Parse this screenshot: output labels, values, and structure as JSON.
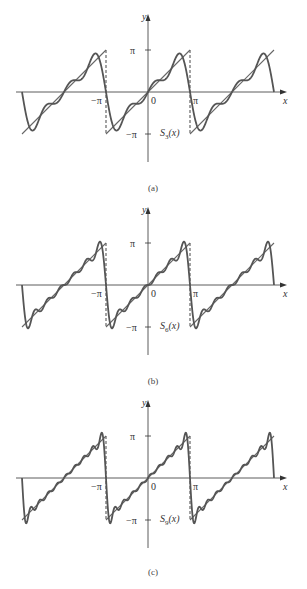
{
  "chart_data": [
    {
      "type": "line",
      "panel": "(a)",
      "title": "",
      "curve_label": "S3(x)",
      "xlabel": "x",
      "ylabel": "y",
      "x_ticks": [
        "−π",
        "0",
        "π"
      ],
      "y_ticks": [
        "π",
        "−π"
      ],
      "xlim": [
        -9.42,
        9.42
      ],
      "ylim": [
        -3.4,
        3.4
      ],
      "grid": false,
      "series": [
        {
          "name": "f(x) = x (periodic sawtooth, period 2π)",
          "style": "thin line with dashed vertical jumps at ±π"
        },
        {
          "name": "S3(x)",
          "n_terms": 3,
          "formula": "2 Σ_{k=1..3} (-1)^{k+1} sin(kx)/k"
        }
      ]
    },
    {
      "type": "line",
      "panel": "(b)",
      "curve_label": "S6(x)",
      "xlabel": "x",
      "ylabel": "y",
      "x_ticks": [
        "−π",
        "0",
        "π"
      ],
      "y_ticks": [
        "π",
        "−π"
      ],
      "xlim": [
        -9.42,
        9.42
      ],
      "ylim": [
        -3.4,
        3.4
      ],
      "grid": false,
      "series": [
        {
          "name": "f(x) = x (periodic sawtooth, period 2π)"
        },
        {
          "name": "S6(x)",
          "n_terms": 6,
          "formula": "2 Σ_{k=1..6} (-1)^{k+1} sin(kx)/k"
        }
      ]
    },
    {
      "type": "line",
      "panel": "(c)",
      "curve_label": "S9(x)",
      "xlabel": "x",
      "ylabel": "y",
      "x_ticks": [
        "−π",
        "0",
        "π"
      ],
      "y_ticks": [
        "π",
        "−π"
      ],
      "xlim": [
        -9.42,
        9.42
      ],
      "ylim": [
        -3.4,
        3.4
      ],
      "grid": false,
      "series": [
        {
          "name": "f(x) = x (periodic sawtooth, period 2π)"
        },
        {
          "name": "S9(x)",
          "n_terms": 9,
          "formula": "2 Σ_{k=1..9} (-1)^{k+1} sin(kx)/k"
        }
      ]
    }
  ],
  "panels": [
    {
      "id": "a",
      "caption": "(a)",
      "curve_label_main": "S",
      "curve_label_sub": "3",
      "curve_label_arg": "(x)",
      "n": 3,
      "axis_y": 92,
      "cap_y": 191
    },
    {
      "id": "b",
      "caption": "(b)",
      "curve_label_main": "S",
      "curve_label_sub": "6",
      "curve_label_arg": "(x)",
      "n": 6,
      "axis_y": 285,
      "cap_y": 384
    },
    {
      "id": "c",
      "caption": "(c)",
      "curve_label_main": "S",
      "curve_label_sub": "9",
      "curve_label_arg": "(x)",
      "n": 9,
      "axis_y": 478,
      "cap_y": 575
    }
  ],
  "axis_labels": {
    "x": "x",
    "y": "y",
    "zero": "0",
    "pi": "π",
    "neg_pi": "−π"
  },
  "colors": {
    "curve": "#555555",
    "axis": "#333333",
    "sawtooth": "#666666"
  }
}
